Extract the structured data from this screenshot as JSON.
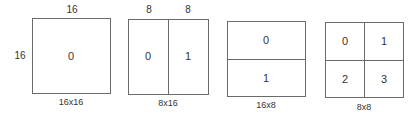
{
  "diagram": {
    "partitions": [
      {
        "caption": "16x16",
        "top_labels": [
          "16"
        ],
        "left_label": "16",
        "cells": [
          "0"
        ]
      },
      {
        "caption": "8x16",
        "top_labels": [
          "8",
          "8"
        ],
        "cells": [
          "0",
          "1"
        ]
      },
      {
        "caption": "16x8",
        "cells": [
          "0",
          "1"
        ]
      },
      {
        "caption": "8x8",
        "cells": [
          "0",
          "1",
          "2",
          "3"
        ]
      }
    ]
  }
}
